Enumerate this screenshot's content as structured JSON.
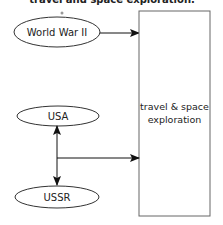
{
  "header": {
    "text": "travel and space exploration."
  },
  "nodes": {
    "world_war_ii": "World War II",
    "usa": "USA",
    "ussr": "USSR",
    "target_line1": "travel & space",
    "target_line2": "exploration"
  },
  "edges": [
    {
      "from": "World War II",
      "to": "travel & space exploration",
      "type": "arrow"
    },
    {
      "from": "USA",
      "to": "USSR",
      "type": "bidirectional-arrow"
    },
    {
      "from": "USA-USSR link",
      "to": "travel & space exploration",
      "type": "arrow"
    }
  ],
  "colors": {
    "stroke": "#333333",
    "box_stroke": "#666666",
    "text": "#222222"
  }
}
